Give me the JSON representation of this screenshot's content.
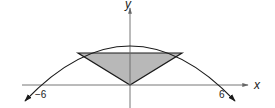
{
  "diagram": {
    "type": "function-graph",
    "axes": {
      "x_label": "x",
      "y_label": "y"
    },
    "tick_labels": {
      "left": "−6",
      "right": "6"
    },
    "parabola": {
      "x_intercepts": [
        -6,
        6
      ],
      "opens": "down"
    },
    "triangle": {
      "apex": [
        0,
        0
      ],
      "fill": "#b5b5b5"
    },
    "colors": {
      "stroke": "#1a1a1a",
      "axis": "#555555",
      "fill": "#b5b5b5"
    }
  }
}
